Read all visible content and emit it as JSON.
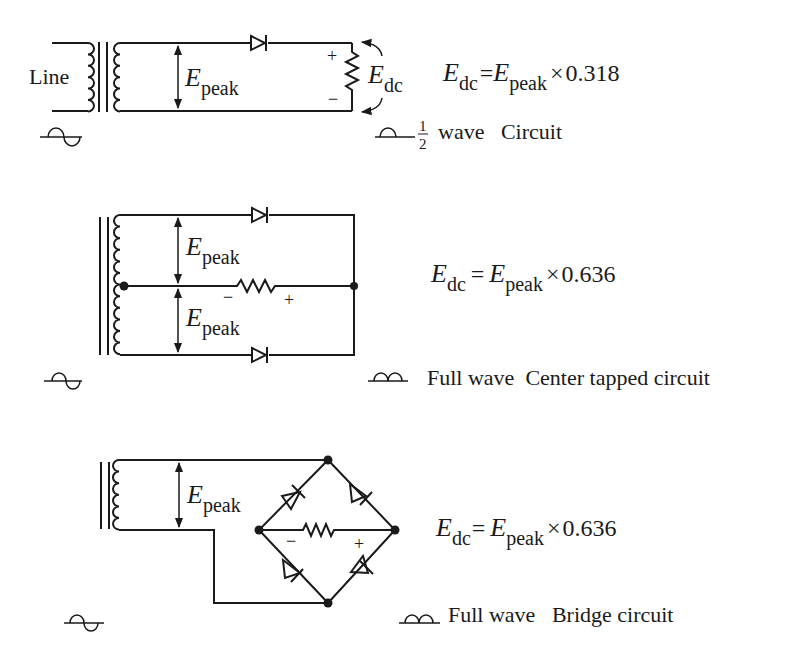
{
  "diagram": {
    "colors": {
      "ink": "#1a1a1a",
      "background": "#ffffff"
    },
    "circuits": [
      {
        "id": "half-wave",
        "title": "wave   Circuit",
        "fraction": {
          "num": "1",
          "den": "2"
        },
        "line_label": "Line",
        "voltage_label": {
          "E": "E",
          "sub": "peak"
        },
        "output_label": {
          "E": "E",
          "sub": "dc"
        },
        "polarity": {
          "plus": "+",
          "minus": "−"
        },
        "formula": {
          "lhs_E": "E",
          "lhs_sub": "dc",
          "eq": "=",
          "rhs_E": "E",
          "rhs_sub": "peak",
          "op": "×",
          "value": "0.318"
        },
        "input_waveform": "sine-wave-icon",
        "output_waveform": "half-wave-icon"
      },
      {
        "id": "full-wave-center-tapped",
        "title": "Full wave  Center tapped circuit",
        "voltage_label_top": {
          "E": "E",
          "sub": "peak"
        },
        "voltage_label_bottom": {
          "E": "E",
          "sub": "peak"
        },
        "polarity": {
          "plus": "+",
          "minus": "−"
        },
        "formula": {
          "lhs_E": "E",
          "lhs_sub": "dc",
          "eq": "=",
          "rhs_E": "E",
          "rhs_sub": "peak",
          "op": "×",
          "value": "0.636"
        },
        "input_waveform": "sine-wave-icon",
        "output_waveform": "full-wave-icon"
      },
      {
        "id": "full-wave-bridge",
        "title": "Full wave   Bridge circuit",
        "voltage_label": {
          "E": "E",
          "sub": "peak"
        },
        "polarity": {
          "plus": "+",
          "minus": "−"
        },
        "formula": {
          "lhs_E": "E",
          "lhs_sub": "dc",
          "eq": "=",
          "rhs_E": "E",
          "rhs_sub": "peak",
          "op": "×",
          "value": "0.636"
        },
        "input_waveform": "sine-wave-icon",
        "output_waveform": "full-wave-icon"
      }
    ]
  }
}
